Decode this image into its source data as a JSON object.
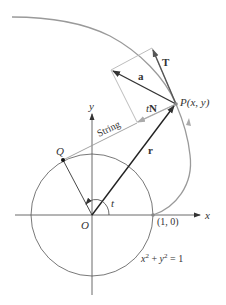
{
  "figure": {
    "labels": {
      "point_P": "P(x, y)",
      "point_Q": "Q",
      "origin": "O",
      "point_1_0": "(1, 0)",
      "axis_x": "x",
      "axis_y": "y",
      "angle": "t",
      "vector_r": "r",
      "vector_T": "T",
      "vector_a": "a",
      "vector_tN_italic": "t",
      "vector_tN_bold": "N",
      "string": "String",
      "circle_eq_x": "x",
      "circle_eq_exp1": "2",
      "circle_eq_plus": " + ",
      "circle_eq_y": "y",
      "circle_eq_exp2": "2",
      "circle_eq_rest": " = 1"
    },
    "colors": {
      "curve": "#9a9a9a",
      "vectors": "#333333",
      "helper": "#b5b5b5",
      "text": "#333333"
    }
  }
}
